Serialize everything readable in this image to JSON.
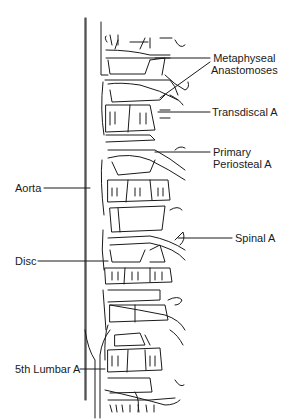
{
  "figure": {
    "stroke_color": "#1a1a1a",
    "background": "#ffffff"
  },
  "labels": {
    "metaphyseal_line1": "Metaphyseal",
    "metaphyseal_line2": "Anastomoses",
    "transdiscal": "Transdiscal A",
    "primary_line1": "Primary",
    "primary_line2": "Periosteal A",
    "aorta": "Aorta",
    "spinal": "Spinal A",
    "disc": "Disc",
    "lumbar5": "5th Lumbar A"
  }
}
